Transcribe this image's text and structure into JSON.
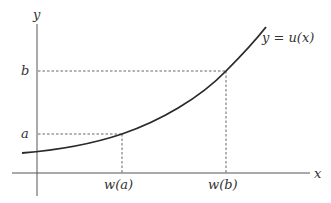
{
  "diagram": {
    "type": "function-graph",
    "axes": {
      "x_label": "x",
      "y_label": "y"
    },
    "curve": {
      "label": "y = u(x)",
      "shape": "increasing convex"
    },
    "y_ticks": [
      {
        "label": "a",
        "y": 134
      },
      {
        "label": "b",
        "y": 71
      }
    ],
    "x_ticks": [
      {
        "label": "w(a)",
        "x": 122
      },
      {
        "label": "w(b)",
        "x": 226
      }
    ],
    "colors": {
      "axis": "#555555",
      "curve": "#2a2a2a",
      "text": "#333333"
    }
  }
}
